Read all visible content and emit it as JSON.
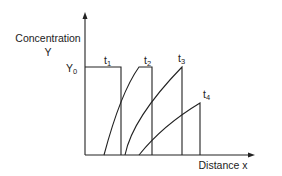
{
  "diagram": {
    "y_axis_label_line1": "Concentration",
    "y_axis_label_line2": "Y",
    "x_axis_label": "Distance x",
    "y0_label": "Y",
    "y0_subscript": "0",
    "curves": [
      {
        "label": "t",
        "subscript": "1"
      },
      {
        "label": "t",
        "subscript": "2"
      },
      {
        "label": "t",
        "subscript": "3"
      },
      {
        "label": "t",
        "subscript": "4"
      }
    ]
  }
}
